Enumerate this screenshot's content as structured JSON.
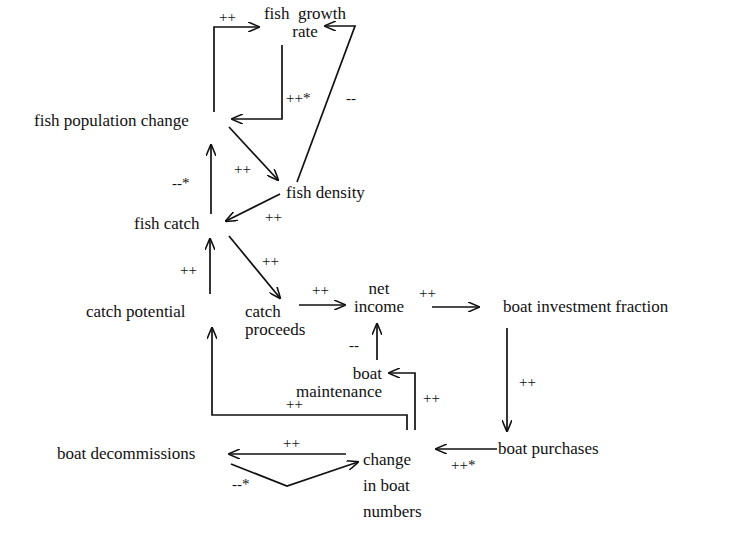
{
  "diagram": {
    "type": "causal-loop",
    "nodes": {
      "fish_growth_rate": {
        "line1": "fish  growth",
        "line2": "rate"
      },
      "fish_population_change": {
        "label": "fish population change"
      },
      "fish_density": {
        "label": "fish density"
      },
      "fish_catch": {
        "label": "fish catch"
      },
      "catch_potential": {
        "label": "catch potential"
      },
      "catch_proceeds": {
        "line1": "catch",
        "line2": "proceeds"
      },
      "net_income": {
        "line1": "net",
        "line2": "income"
      },
      "boat_investment_fraction": {
        "label": "boat investment fraction"
      },
      "boat_maintenance": {
        "line1": "boat",
        "line2": "maintenance"
      },
      "boat_purchases": {
        "label": "boat purchases"
      },
      "boat_decommissions": {
        "label": "boat decommissions"
      },
      "change_in_boat_numbers": {
        "line1": "change",
        "line2": "in boat",
        "line3": "numbers"
      }
    },
    "edges": [
      {
        "from": "fish population change",
        "to": "fish growth rate",
        "sign": "++"
      },
      {
        "from": "fish growth rate",
        "to": "fish population change",
        "sign": "++*"
      },
      {
        "from": "fish density",
        "to": "fish growth rate",
        "sign": "--"
      },
      {
        "from": "fish population change",
        "to": "fish density",
        "sign": "++"
      },
      {
        "from": "fish density",
        "to": "fish catch",
        "sign": "++"
      },
      {
        "from": "fish catch",
        "to": "fish population change",
        "sign": "--*"
      },
      {
        "from": "catch potential",
        "to": "fish catch",
        "sign": "++"
      },
      {
        "from": "fish catch",
        "to": "catch proceeds",
        "sign": "++"
      },
      {
        "from": "catch proceeds",
        "to": "net income",
        "sign": "++"
      },
      {
        "from": "net income",
        "to": "boat investment fraction",
        "sign": "++"
      },
      {
        "from": "boat maintenance",
        "to": "net income",
        "sign": "--"
      },
      {
        "from": "boat investment fraction",
        "to": "boat purchases",
        "sign": "++"
      },
      {
        "from": "change in boat numbers",
        "to": "boat maintenance",
        "sign": "++"
      },
      {
        "from": "change in boat numbers",
        "to": "catch potential",
        "sign": "++"
      },
      {
        "from": "boat purchases",
        "to": "change in boat numbers",
        "sign": "++*"
      },
      {
        "from": "change in boat numbers",
        "to": "boat decommissions",
        "sign": "++"
      },
      {
        "from": "boat decommissions",
        "to": "change in boat numbers",
        "sign": "--*"
      }
    ]
  }
}
